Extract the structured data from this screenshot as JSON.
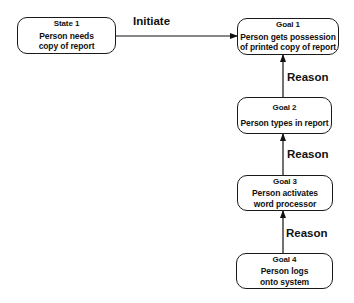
{
  "nodes": [
    {
      "id": "state1",
      "title": "State 1",
      "desc": "Person needs\ncopy of report"
    },
    {
      "id": "goal1",
      "title": "Goal 1",
      "desc": "Person gets possession\nof printed copy of report"
    },
    {
      "id": "goal2",
      "title": "Goal 2",
      "desc": "Person types in report"
    },
    {
      "id": "goal3",
      "title": "Goal 3",
      "desc": "Person activates\nword processor"
    },
    {
      "id": "goal4",
      "title": "Goal 4",
      "desc": "Person logs\nonto  system"
    }
  ],
  "edges": [
    {
      "from": "state1",
      "to": "goal1",
      "label": "Initiate"
    },
    {
      "from": "goal2",
      "to": "goal1",
      "label": "Reason"
    },
    {
      "from": "goal3",
      "to": "goal2",
      "label": "Reason"
    },
    {
      "from": "goal4",
      "to": "goal3",
      "label": "Reason"
    }
  ]
}
